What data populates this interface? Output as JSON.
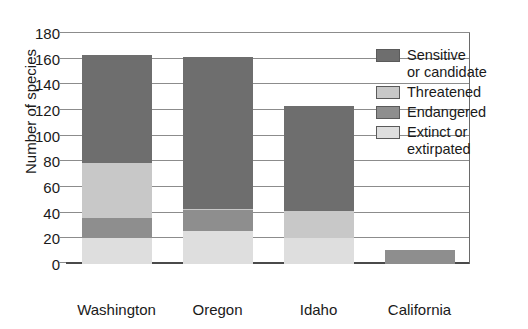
{
  "chart_data": {
    "type": "bar",
    "subtype": "stacked-vertical",
    "title": "",
    "xlabel": "State",
    "ylabel": "Number of species",
    "categories": [
      "Washington",
      "Oregon",
      "Idaho",
      "California"
    ],
    "ylim": [
      0,
      180
    ],
    "yticks": [
      0,
      20,
      40,
      60,
      80,
      100,
      120,
      140,
      160,
      180
    ],
    "ytick_labels": [
      "0",
      "20",
      "40",
      "60",
      "80",
      "100",
      "120",
      "140",
      "160",
      "180"
    ],
    "grid": true,
    "grid_axis": "y",
    "legend_position": "inside-upper-right",
    "series": [
      {
        "name": "Extinct or extirpated",
        "key": "extinct",
        "color": "#dedede",
        "stack_order": 1,
        "values": [
          20,
          26,
          20,
          0
        ]
      },
      {
        "name": "Endangered",
        "key": "endangered",
        "color": "#8e8e8e",
        "stack_order": 2,
        "values": [
          16,
          16,
          0,
          11
        ]
      },
      {
        "name": "Threatened",
        "key": "threatened",
        "color": "#c8c8c8",
        "stack_order": 3,
        "values": [
          43,
          1,
          21,
          0
        ]
      },
      {
        "name": "Sensitive or candidate",
        "key": "sensitive",
        "color": "#6e6e6e",
        "stack_order": 4,
        "values": [
          84,
          118,
          82,
          0
        ]
      }
    ],
    "totals": [
      163,
      161,
      123,
      11
    ]
  },
  "legend": {
    "items": [
      {
        "label": "Sensitive\nor candidate",
        "color": "#6e6e6e",
        "swatch_name": "sensitive-swatch"
      },
      {
        "label": "Threatened",
        "color": "#c8c8c8",
        "swatch_name": "threatened-swatch"
      },
      {
        "label": "Endangered",
        "color": "#8e8e8e",
        "swatch_name": "endangered-swatch"
      },
      {
        "label": "Extinct or\nextirpated",
        "color": "#dedede",
        "swatch_name": "extinct-swatch"
      }
    ]
  },
  "axes": {
    "x_title": "State",
    "y_title": "Number of species"
  }
}
